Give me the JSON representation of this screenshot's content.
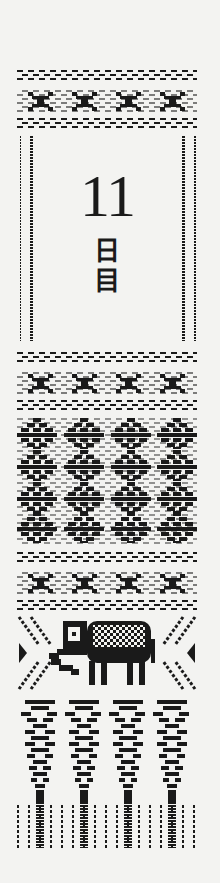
{
  "card": {
    "number": "11",
    "unit_line1": "日",
    "unit_line2": "目",
    "ink_color": "#1a1a1a",
    "paper_color": "#f3f3f1"
  },
  "bands": [
    {
      "name": "top-dash-motif-band",
      "motif": "dashes-and-bowtie",
      "repeat": 4
    },
    {
      "name": "side-rails",
      "motif": "dotted-double-rails"
    },
    {
      "name": "middle-dash-motif-band",
      "motif": "dashes-and-bowtie",
      "repeat": 4
    },
    {
      "name": "diamond-band",
      "motif": "stacked-diamonds",
      "columns": 4,
      "rows": 4
    },
    {
      "name": "lower-dash-motif-band",
      "motif": "dashes-and-bowtie",
      "repeat": 4
    },
    {
      "name": "elephant-band",
      "motif": "elephant-with-chevrons"
    },
    {
      "name": "fringe-band",
      "motif": "tapering-diamonds-with-fringe",
      "columns": 4
    }
  ]
}
